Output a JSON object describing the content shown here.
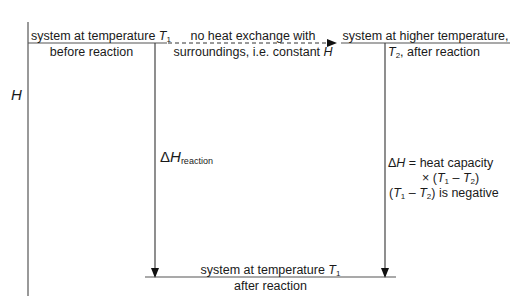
{
  "axis": {
    "label": "H"
  },
  "levels": {
    "initial": {
      "line1": "system at temperature ",
      "var": "T",
      "sub": "1",
      "line2": "before reaction"
    },
    "hot": {
      "line1": "system at higher temperature,",
      "var": "T",
      "sub": "2",
      "line2_rest": ", after reaction"
    },
    "final": {
      "line1": "system at temperature ",
      "var": "T",
      "sub": "1",
      "line2": "after reaction"
    }
  },
  "adiabatic": {
    "line1": "no heat exchange with",
    "line2": "surroundings, i.e. constant ",
    "var": "H"
  },
  "delta_reaction": {
    "delta": "Δ",
    "var": "H",
    "sub": "reaction"
  },
  "delta_heat": {
    "line1_delta": "Δ",
    "line1_var": "H",
    "line1_rest": " = heat capacity",
    "line2_prefix": "× (",
    "line2_t1": "T",
    "line2_sub1": "1",
    "line2_minus": " – ",
    "line2_t2": "T",
    "line2_sub2": "2",
    "line2_suffix": ")",
    "line3_prefix": "(",
    "line3_t1": "T",
    "line3_sub1": "1",
    "line3_minus": " – ",
    "line3_t2": "T",
    "line3_sub2": "2",
    "line3_suffix": ") is negative"
  }
}
